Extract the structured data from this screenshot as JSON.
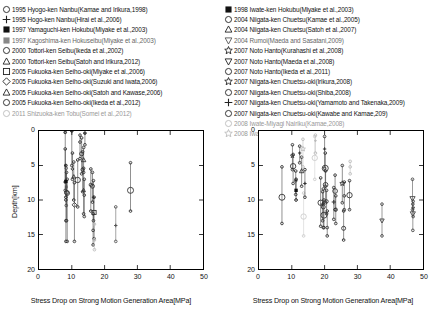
{
  "legend": {
    "left_column": [
      {
        "marker": "circle-open",
        "color": "#222",
        "label": "1995 Hyogo-ken Nanbu(Kamae and Irikura,1998)"
      },
      {
        "marker": "plus",
        "color": "#222",
        "label": "1995 Hogo-ken Nanbu(Hirai et al.,2006)"
      },
      {
        "marker": "square-filled",
        "color": "#111",
        "label": "1997 Yamaguchi-ken Hokubu(Miyake et al.,2003)"
      },
      {
        "marker": "square-filled",
        "color": "#888",
        "label": "1997 Kagoshima-ken Hokuseibu(Miyake et al.,2003)"
      },
      {
        "marker": "circle-open",
        "color": "#222",
        "label": "2000 Tottori-ken Seibu(Ikeda et al.,2002)"
      },
      {
        "marker": "triangle-up-open",
        "color": "#222",
        "label": "2000 Tottori-ken Seibu(Satoh and Irikura,2012)"
      },
      {
        "marker": "square-open",
        "color": "#222",
        "label": "2005 Fukuoka-ken Seiho-oki(Miyake et al.,2006)"
      },
      {
        "marker": "diamond-open",
        "color": "#222",
        "label": "2005 Fukuoka-ken Seiho-oki(Suzuki and Iwata,2006)"
      },
      {
        "marker": "triangle-up-open",
        "color": "#222",
        "label": "2005 Fukuoka-ken Seiho-oki(Satoh and Kawase,2006)"
      },
      {
        "marker": "circle-open",
        "color": "#222",
        "label": "2005 Fukuoka-ken Seiho-oki(Ikeda et al.,2012)"
      },
      {
        "marker": "circle-open",
        "color": "#bbb",
        "label": "2011 Shizuoka-ken Tobu(Somei et al.,2012)"
      }
    ],
    "right_column": [
      {
        "marker": "square-filled",
        "color": "#111",
        "label": "1998 Iwate-ken Hokubu(Miyake et al.,2003)"
      },
      {
        "marker": "circle-open",
        "color": "#222",
        "label": "2004 Niigata-ken Chuetsu(Kamae et al.,2005)"
      },
      {
        "marker": "triangle-up-open",
        "color": "#222",
        "label": "2004 Niigata-ken Chuetsu(Satoh et al.,2007)"
      },
      {
        "marker": "triangle-down-open",
        "color": "#555",
        "label": "2004 Rumoi(Maeda and Sasatani,2009)"
      },
      {
        "marker": "star-open",
        "color": "#222",
        "label": "2007 Noto Hanto(Kurahashi et al.,2008)"
      },
      {
        "marker": "triangle-down-open",
        "color": "#222",
        "label": "2007 Noto Hanto(Maeda et al.,2008)"
      },
      {
        "marker": "circle-open",
        "color": "#222",
        "label": "2007 Noto Hanto(Ikeda et al.,2011)"
      },
      {
        "marker": "star-open",
        "color": "#222",
        "label": "2007 Niigata-ken Chuetsu-oki(Irikura,2008)"
      },
      {
        "marker": "circle-open",
        "color": "#222",
        "label": "2007 Niigata-ken Chuetsu-oki(Shiba,2008)"
      },
      {
        "marker": "plus",
        "color": "#222",
        "label": "2007 Niigata-ken Chuetsu-oki(Yamamoto and Takenaka,2009)"
      },
      {
        "marker": "circle-open",
        "color": "#222",
        "label": "2007 Niigata-ken Chuetsu-oki(Kawabe and Kamae,209)"
      },
      {
        "marker": "circle-open",
        "color": "#bbb",
        "label": "2008 Iwate-Miyagi Nairiku(Kamae,2008)"
      },
      {
        "marker": "star-open",
        "color": "#bbb",
        "label": "2008 Iwate-Miyagi Nairiku(Irikura and Kurahashi,2008)"
      }
    ]
  },
  "chart_data": [
    {
      "id": "left-panel",
      "type": "scatter",
      "title": "",
      "xlabel": "Stress Drop on Strong Motion Generation Area[MPa]",
      "ylabel": "Depth[km]",
      "xlim": [
        0,
        50
      ],
      "ylim": [
        20,
        0
      ],
      "y_inverted": true,
      "xticks": [
        0,
        10,
        20,
        30,
        40,
        50
      ],
      "yticks": [
        0,
        5,
        10,
        15,
        20
      ],
      "grid": false,
      "points": [
        {
          "x": 8.0,
          "y": 0.2,
          "ylo": 0.2,
          "yhi": 8.6,
          "marker": "circle-open",
          "size": 3,
          "color": "#333"
        },
        {
          "x": 8.0,
          "y": 5.0,
          "ylo": 2.6,
          "yhi": 7.4,
          "marker": "plus",
          "size": 3,
          "color": "#333"
        },
        {
          "x": 8.2,
          "y": 7.3,
          "ylo": 5.0,
          "yhi": 9.6,
          "marker": "square-filled",
          "size": 5,
          "color": "#111"
        },
        {
          "x": 8.3,
          "y": 8.1,
          "ylo": 5.4,
          "yhi": 10.8,
          "marker": "square-filled",
          "size": 4,
          "color": "#555"
        },
        {
          "x": 8.4,
          "y": 8.9,
          "ylo": 6.0,
          "yhi": 13.0,
          "marker": "circle-open",
          "size": 6,
          "color": "#333"
        },
        {
          "x": 8.6,
          "y": 9.0,
          "ylo": 7.0,
          "yhi": 16.0,
          "marker": "circle-open",
          "size": 7,
          "color": "#333"
        },
        {
          "x": 8.2,
          "y": 13.0,
          "ylo": 10.0,
          "yhi": 16.0,
          "marker": "circle-open",
          "size": 4,
          "color": "#333"
        },
        {
          "x": 10.0,
          "y": 0.0,
          "ylo": 0.0,
          "yhi": 5.0,
          "marker": "plus",
          "size": 3,
          "color": "#333"
        },
        {
          "x": 10.2,
          "y": 5.5,
          "ylo": 3.2,
          "yhi": 7.0,
          "marker": "diamond-open",
          "size": 4,
          "color": "#333"
        },
        {
          "x": 10.6,
          "y": 6.6,
          "ylo": 4.5,
          "yhi": 10.0,
          "marker": "triangle-up-open",
          "size": 5,
          "color": "#333"
        },
        {
          "x": 10.8,
          "y": 10.7,
          "ylo": 7.5,
          "yhi": 16.0,
          "marker": "diamond-open",
          "size": 6,
          "color": "#333"
        },
        {
          "x": 11.8,
          "y": 7.1,
          "ylo": 4.2,
          "yhi": 11.0,
          "marker": "circle-open",
          "size": 8,
          "color": "#333"
        },
        {
          "x": 12.5,
          "y": 1.6,
          "ylo": 0.6,
          "yhi": 4.0,
          "marker": "circle-open",
          "size": 4,
          "color": "#333"
        },
        {
          "x": 13.0,
          "y": 3.3,
          "ylo": 1.0,
          "yhi": 6.2,
          "marker": "circle-open",
          "size": 6,
          "color": "#333"
        },
        {
          "x": 13.6,
          "y": 4.2,
          "ylo": 2.4,
          "yhi": 6.0,
          "marker": "triangle-up-open",
          "size": 6,
          "color": "#333"
        },
        {
          "x": 13.3,
          "y": 5.6,
          "ylo": 3.0,
          "yhi": 8.8,
          "marker": "circle-open",
          "size": 5,
          "color": "#333"
        },
        {
          "x": 13.6,
          "y": 8.6,
          "ylo": 5.4,
          "yhi": 12.0,
          "marker": "triangle-up-open",
          "size": 5,
          "color": "#333"
        },
        {
          "x": 13.8,
          "y": 9.3,
          "ylo": 7.0,
          "yhi": 12.4,
          "marker": "circle-open",
          "size": 4,
          "color": "#333"
        },
        {
          "x": 14.0,
          "y": 0.3,
          "ylo": 0.3,
          "yhi": 2.0,
          "marker": "triangle-up-open",
          "size": 3,
          "color": "#333"
        },
        {
          "x": 15.8,
          "y": 7.8,
          "ylo": 5.5,
          "yhi": 11.6,
          "marker": "circle-open",
          "size": 5,
          "color": "#333"
        },
        {
          "x": 16.3,
          "y": 8.0,
          "ylo": 6.0,
          "yhi": 10.3,
          "marker": "circle-open",
          "size": 6,
          "color": "#333"
        },
        {
          "x": 16.6,
          "y": 9.6,
          "ylo": 7.2,
          "yhi": 13.0,
          "marker": "plus",
          "size": 4,
          "color": "#333"
        },
        {
          "x": 16.8,
          "y": 11.8,
          "ylo": 9.6,
          "yhi": 15.6,
          "marker": "square-open",
          "size": 6,
          "color": "#333"
        },
        {
          "x": 16.5,
          "y": 14.4,
          "ylo": 12.0,
          "yhi": 16.5,
          "marker": "circle-open",
          "size": 4,
          "color": "#333"
        },
        {
          "x": 16.9,
          "y": 15.8,
          "ylo": 13.5,
          "yhi": 17.2,
          "marker": "circle-open",
          "size": 4,
          "color": "#bbb"
        },
        {
          "x": 23.4,
          "y": 13.7,
          "ylo": 11.0,
          "yhi": 16.0,
          "marker": "plus",
          "size": 4,
          "color": "#555"
        },
        {
          "x": 27.9,
          "y": 8.6,
          "ylo": 4.6,
          "yhi": 11.6,
          "marker": "circle-open",
          "size": 9,
          "color": "#333"
        }
      ]
    },
    {
      "id": "right-panel",
      "type": "scatter",
      "title": "",
      "xlabel": "Stress Drop on Strong Motion Generation Area[MPa]",
      "ylabel": "",
      "xlim": [
        0,
        50
      ],
      "ylim": [
        20,
        0
      ],
      "y_inverted": true,
      "xticks": [
        0,
        10,
        20,
        30,
        40,
        50
      ],
      "yticks": [
        0,
        5,
        10,
        15,
        20
      ],
      "grid": false,
      "points": [
        {
          "x": 7.0,
          "y": 9.6,
          "ylo": 5.2,
          "yhi": 13.4,
          "marker": "circle-open",
          "size": 9,
          "color": "#333"
        },
        {
          "x": 10.2,
          "y": 3.6,
          "ylo": 2.0,
          "yhi": 5.6,
          "marker": "star-open",
          "size": 5,
          "color": "#333"
        },
        {
          "x": 10.4,
          "y": 5.1,
          "ylo": 3.4,
          "yhi": 7.6,
          "marker": "circle-open",
          "size": 8,
          "color": "#333"
        },
        {
          "x": 11.2,
          "y": 7.2,
          "ylo": 5.8,
          "yhi": 9.2,
          "marker": "circle-open",
          "size": 4,
          "color": "#333"
        },
        {
          "x": 11.3,
          "y": 8.6,
          "ylo": 7.0,
          "yhi": 10.0,
          "marker": "square-filled",
          "size": 5,
          "color": "#111"
        },
        {
          "x": 12.4,
          "y": 3.2,
          "ylo": 2.2,
          "yhi": 4.6,
          "marker": "plus",
          "size": 4,
          "color": "#333"
        },
        {
          "x": 13.0,
          "y": 5.8,
          "ylo": 3.8,
          "yhi": 8.0,
          "marker": "triangle-up-open",
          "size": 6,
          "color": "#333"
        },
        {
          "x": 13.4,
          "y": 2.6,
          "ylo": 1.2,
          "yhi": 5.2,
          "marker": "star-open",
          "size": 6,
          "color": "#bbb"
        },
        {
          "x": 13.6,
          "y": 12.4,
          "ylo": 9.0,
          "yhi": 15.2,
          "marker": "circle-open",
          "size": 8,
          "color": "#ccc"
        },
        {
          "x": 14.0,
          "y": 7.6,
          "ylo": 5.6,
          "yhi": 9.6,
          "marker": "plus",
          "size": 4,
          "color": "#333"
        },
        {
          "x": 17.0,
          "y": 3.9,
          "ylo": 0.8,
          "yhi": 7.0,
          "marker": "circle-open",
          "size": 8,
          "color": "#ccc"
        },
        {
          "x": 17.2,
          "y": 1.4,
          "ylo": 0.6,
          "yhi": 3.2,
          "marker": "plus",
          "size": 3,
          "color": "#bbb"
        },
        {
          "x": 18.8,
          "y": 10.4,
          "ylo": 6.8,
          "yhi": 13.8,
          "marker": "circle-open",
          "size": 8,
          "color": "#333"
        },
        {
          "x": 19.4,
          "y": 10.6,
          "ylo": 8.8,
          "yhi": 13.0,
          "marker": "plus",
          "size": 5,
          "color": "#333"
        },
        {
          "x": 19.6,
          "y": 11.0,
          "ylo": 8.4,
          "yhi": 14.0,
          "marker": "circle-open",
          "size": 6,
          "color": "#333"
        },
        {
          "x": 19.8,
          "y": 12.2,
          "ylo": 10.0,
          "yhi": 14.0,
          "marker": "circle-open",
          "size": 9,
          "color": "#333"
        },
        {
          "x": 20.0,
          "y": 2.6,
          "ylo": 0.8,
          "yhi": 5.4,
          "marker": "plus",
          "size": 4,
          "color": "#333"
        },
        {
          "x": 20.2,
          "y": 5.4,
          "ylo": 3.2,
          "yhi": 8.0,
          "marker": "circle-open",
          "size": 9,
          "color": "#333"
        },
        {
          "x": 20.3,
          "y": 7.8,
          "ylo": 5.8,
          "yhi": 10.4,
          "marker": "circle-open",
          "size": 7,
          "color": "#333"
        },
        {
          "x": 20.6,
          "y": 10.2,
          "ylo": 8.6,
          "yhi": 12.0,
          "marker": "circle-open",
          "size": 5,
          "color": "#333"
        },
        {
          "x": 20.8,
          "y": 14.0,
          "ylo": 11.6,
          "yhi": 15.2,
          "marker": "circle-open",
          "size": 4,
          "color": "#333"
        },
        {
          "x": 22.8,
          "y": 10.3,
          "ylo": 8.2,
          "yhi": 12.8,
          "marker": "plus",
          "size": 5,
          "color": "#333"
        },
        {
          "x": 23.2,
          "y": 8.7,
          "ylo": 6.4,
          "yhi": 11.4,
          "marker": "circle-open",
          "size": 7,
          "color": "#333"
        },
        {
          "x": 23.4,
          "y": 11.4,
          "ylo": 9.4,
          "yhi": 13.4,
          "marker": "circle-open",
          "size": 5,
          "color": "#333"
        },
        {
          "x": 25.4,
          "y": 7.6,
          "ylo": 5.0,
          "yhi": 10.4,
          "marker": "star-open",
          "size": 6,
          "color": "#333"
        },
        {
          "x": 25.8,
          "y": 14.1,
          "ylo": 11.6,
          "yhi": 15.8,
          "marker": "circle-open",
          "size": 6,
          "color": "#333"
        },
        {
          "x": 26.0,
          "y": 9.4,
          "ylo": 7.4,
          "yhi": 11.4,
          "marker": "circle-open",
          "size": 4,
          "color": "#333"
        },
        {
          "x": 27.6,
          "y": 9.3,
          "ylo": 7.2,
          "yhi": 11.4,
          "marker": "circle-open",
          "size": 8,
          "color": "#333"
        },
        {
          "x": 27.8,
          "y": 5.2,
          "ylo": 4.4,
          "yhi": 6.2,
          "marker": "circle-open",
          "size": 4,
          "color": "#bbb"
        },
        {
          "x": 37.5,
          "y": 13.0,
          "ylo": 10.6,
          "yhi": 15.2,
          "marker": "triangle-down-open",
          "size": 6,
          "color": "#444"
        },
        {
          "x": 46.8,
          "y": 9.8,
          "ylo": 7.0,
          "yhi": 11.4,
          "marker": "triangle-down-open",
          "size": 7,
          "color": "#444"
        },
        {
          "x": 46.9,
          "y": 12.0,
          "ylo": 10.6,
          "yhi": 14.4,
          "marker": "triangle-down-open",
          "size": 7,
          "color": "#444"
        },
        {
          "x": 47.0,
          "y": 11.2,
          "ylo": 10.2,
          "yhi": 12.4,
          "marker": "triangle-down-open",
          "size": 4,
          "color": "#444"
        }
      ]
    }
  ],
  "axes": {
    "xlabel": "Stress Drop on Strong Motion Generation Area[MPa]",
    "ylabel": "Depth[km]",
    "xticks": [
      "0",
      "10",
      "20",
      "30",
      "40",
      "50"
    ],
    "yticks": [
      "0",
      "5",
      "10",
      "15",
      "20"
    ]
  }
}
